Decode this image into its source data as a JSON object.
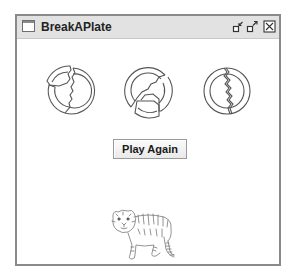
{
  "window": {
    "title": "BreakAPlate",
    "controls": [
      "iconify",
      "maximize",
      "close"
    ]
  },
  "plates": [
    {
      "id": 1,
      "state": "broken",
      "icon": "broken-plate-icon"
    },
    {
      "id": 2,
      "state": "broken",
      "icon": "broken-plate-icon"
    },
    {
      "id": 3,
      "state": "cracked",
      "icon": "cracked-plate-icon"
    }
  ],
  "play_button": {
    "label": "Play Again"
  },
  "prize": {
    "icon": "tiger-icon",
    "description": "Tiger prize image"
  },
  "colors": {
    "frame_border": "#8a8a8a",
    "titlebar_bg": "#e2e2e2",
    "plate_stroke": "#555555",
    "background": "#ffffff"
  }
}
